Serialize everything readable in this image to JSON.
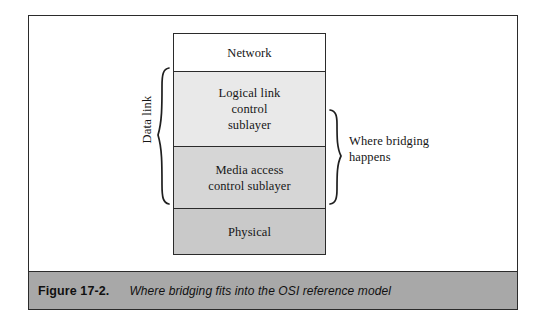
{
  "figure": {
    "caption_number": "Figure 17-2.",
    "caption_text": "Where bridging fits into the OSI reference model",
    "border_color": "#2b2b2b",
    "caption_bar_color": "#a8a8a8"
  },
  "diagram": {
    "type": "layered-stack",
    "layers": [
      {
        "id": "network",
        "label": "Network",
        "fill": "#ffffff"
      },
      {
        "id": "llc",
        "label": "Logical link\ncontrol\nsublayer",
        "fill": "#e9e9e9"
      },
      {
        "id": "mac",
        "label": "Media access\ncontrol sublayer",
        "fill": "#d6d6d6"
      },
      {
        "id": "physical",
        "label": "Physical",
        "fill": "#c9c9c9"
      }
    ],
    "layer_labels": {
      "network": "Network",
      "llc_line1": "Logical link",
      "llc_line2": "control",
      "llc_line3": "sublayer",
      "mac_line1": "Media access",
      "mac_line2": "control sublayer",
      "physical": "Physical"
    },
    "annotations": {
      "left_brace_label": "Data link",
      "left_brace_spans": [
        "llc",
        "mac"
      ],
      "right_brace_label_line1": "Where bridging",
      "right_brace_label_line2": "happens",
      "right_brace_spans": [
        "llc",
        "mac"
      ]
    }
  }
}
